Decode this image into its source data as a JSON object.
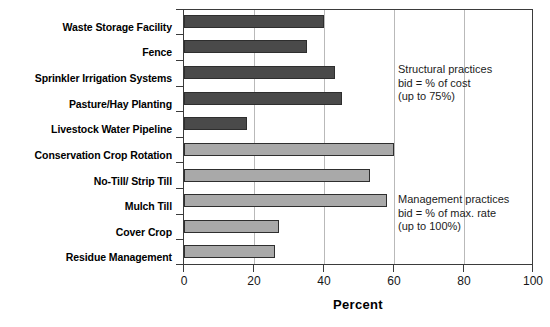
{
  "chart_data": {
    "type": "bar",
    "orientation": "horizontal",
    "title": "",
    "xlabel": "Percent",
    "ylabel": "",
    "xlim": [
      0,
      100
    ],
    "xticks": [
      "0",
      "20",
      "40",
      "60",
      "80",
      "100"
    ],
    "grid": "vertical gridlines at 20, 40, 60, 80",
    "legend": "none",
    "categories": [
      "Waste Storage Facility",
      "Fence",
      "Sprinkler Irrigation Systems",
      "Pasture/Hay Planting",
      "Livestock Water Pipeline",
      "Conservation Crop Rotation",
      "No-Till/ Strip Till",
      "Mulch Till",
      "Cover Crop",
      "Residue Management"
    ],
    "values": [
      40,
      35,
      43,
      45,
      18,
      60,
      53,
      58,
      27,
      26
    ],
    "groups": [
      "structural",
      "structural",
      "structural",
      "structural",
      "structural",
      "management",
      "management",
      "management",
      "management",
      "management"
    ],
    "group_colors": {
      "structural": "#4a4a4a",
      "management": "#a9a9a9"
    },
    "annotations": [
      {
        "name": "structural-note",
        "lines": [
          "Structural practices",
          "bid = % of cost",
          "(up to 75%)"
        ]
      },
      {
        "name": "management-note",
        "lines": [
          "Management practices",
          "bid = % of max. rate",
          "(up to 100%)"
        ]
      }
    ]
  }
}
